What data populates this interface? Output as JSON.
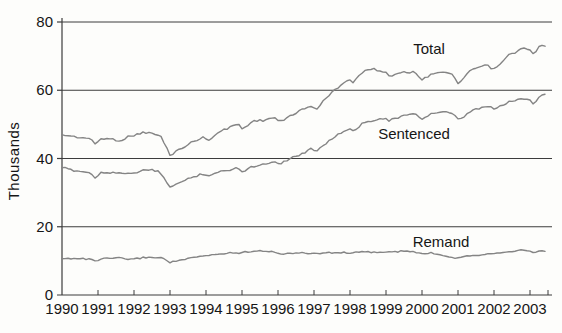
{
  "figure": {
    "background": "#fdfdfb",
    "description_visible_text_only": true
  },
  "chart_data": {
    "type": "line",
    "title": "",
    "xlabel": "",
    "ylabel": "Thousands",
    "ylim": [
      0,
      80
    ],
    "yticks": [
      0,
      20,
      40,
      60,
      80
    ],
    "x_years": [
      1990,
      1991,
      1992,
      1993,
      1994,
      1995,
      1996,
      1997,
      1998,
      1999,
      2000,
      2001,
      2002,
      2003
    ],
    "x_range": [
      1990.0,
      2003.45
    ],
    "grid": "horizontal-only",
    "legend_position": "inline-labels",
    "line_color": "#848484",
    "axis_color": "#3c3c3c",
    "text_color": "#161616",
    "series": [
      {
        "name": "Total",
        "jitter_px": 1.1,
        "points": [
          [
            1990.0,
            47.0
          ],
          [
            1990.35,
            46.4
          ],
          [
            1990.75,
            45.9
          ],
          [
            1990.92,
            44.3
          ],
          [
            1991.1,
            45.9
          ],
          [
            1991.45,
            45.6
          ],
          [
            1991.6,
            45.2
          ],
          [
            1991.9,
            46.6
          ],
          [
            1992.3,
            47.7
          ],
          [
            1992.55,
            47.2
          ],
          [
            1992.75,
            46.4
          ],
          [
            1993.0,
            41.0
          ],
          [
            1993.3,
            42.9
          ],
          [
            1993.6,
            44.7
          ],
          [
            1993.9,
            46.2
          ],
          [
            1994.05,
            45.4
          ],
          [
            1994.4,
            47.9
          ],
          [
            1994.9,
            50.3
          ],
          [
            1995.02,
            48.4
          ],
          [
            1995.25,
            50.8
          ],
          [
            1995.6,
            51.2
          ],
          [
            1995.9,
            52.1
          ],
          [
            1996.05,
            50.6
          ],
          [
            1996.5,
            53.5
          ],
          [
            1996.95,
            55.5
          ],
          [
            1997.07,
            54.4
          ],
          [
            1997.3,
            57.3
          ],
          [
            1997.6,
            60.3
          ],
          [
            1997.95,
            63.3
          ],
          [
            1998.08,
            62.4
          ],
          [
            1998.35,
            65.2
          ],
          [
            1998.6,
            66.4
          ],
          [
            1998.95,
            65.4
          ],
          [
            1999.1,
            64.2
          ],
          [
            1999.5,
            65.5
          ],
          [
            1999.85,
            65.1
          ],
          [
            2000.0,
            62.9
          ],
          [
            2000.25,
            64.8
          ],
          [
            2000.55,
            65.5
          ],
          [
            2000.85,
            64.4
          ],
          [
            2001.02,
            61.9
          ],
          [
            2001.4,
            66.2
          ],
          [
            2001.8,
            67.3
          ],
          [
            2002.02,
            66.0
          ],
          [
            2002.4,
            70.2
          ],
          [
            2002.75,
            72.0
          ],
          [
            2002.95,
            72.4
          ],
          [
            2003.1,
            70.3
          ],
          [
            2003.3,
            73.3
          ],
          [
            2003.45,
            72.8
          ]
        ]
      },
      {
        "name": "Sentenced",
        "jitter_px": 1.1,
        "points": [
          [
            1990.0,
            37.3
          ],
          [
            1990.35,
            36.5
          ],
          [
            1990.75,
            35.9
          ],
          [
            1990.92,
            34.5
          ],
          [
            1991.1,
            35.9
          ],
          [
            1991.5,
            36.0
          ],
          [
            1991.9,
            35.3
          ],
          [
            1992.1,
            36.1
          ],
          [
            1992.4,
            36.8
          ],
          [
            1992.7,
            36.0
          ],
          [
            1993.0,
            31.8
          ],
          [
            1993.3,
            33.0
          ],
          [
            1993.6,
            34.4
          ],
          [
            1993.9,
            35.6
          ],
          [
            1994.05,
            35.0
          ],
          [
            1994.4,
            36.1
          ],
          [
            1994.9,
            37.3
          ],
          [
            1995.02,
            36.2
          ],
          [
            1995.25,
            37.5
          ],
          [
            1995.6,
            38.3
          ],
          [
            1995.9,
            39.2
          ],
          [
            1996.05,
            38.5
          ],
          [
            1996.35,
            40.1
          ],
          [
            1996.65,
            41.3
          ],
          [
            1996.95,
            42.9
          ],
          [
            1997.07,
            42.3
          ],
          [
            1997.3,
            44.3
          ],
          [
            1997.6,
            46.6
          ],
          [
            1997.95,
            48.6
          ],
          [
            1998.08,
            48.1
          ],
          [
            1998.35,
            50.2
          ],
          [
            1998.7,
            51.5
          ],
          [
            1998.95,
            51.9
          ],
          [
            1999.1,
            51.1
          ],
          [
            1999.5,
            52.6
          ],
          [
            1999.85,
            52.9
          ],
          [
            2000.0,
            51.6
          ],
          [
            2000.25,
            53.1
          ],
          [
            2000.55,
            53.7
          ],
          [
            2000.85,
            53.1
          ],
          [
            2001.02,
            51.1
          ],
          [
            2001.4,
            54.1
          ],
          [
            2001.8,
            55.3
          ],
          [
            2002.02,
            54.5
          ],
          [
            2002.4,
            56.5
          ],
          [
            2002.75,
            57.4
          ],
          [
            2002.95,
            57.7
          ],
          [
            2003.1,
            55.9
          ],
          [
            2003.3,
            58.7
          ],
          [
            2003.45,
            58.9
          ]
        ]
      },
      {
        "name": "Remand",
        "jitter_px": 0.75,
        "points": [
          [
            1990.0,
            10.6
          ],
          [
            1990.4,
            10.8
          ],
          [
            1990.8,
            10.4
          ],
          [
            1990.95,
            10.0
          ],
          [
            1991.2,
            10.7
          ],
          [
            1991.6,
            10.8
          ],
          [
            1991.95,
            10.4
          ],
          [
            1992.2,
            10.9
          ],
          [
            1992.5,
            11.1
          ],
          [
            1992.8,
            10.8
          ],
          [
            1993.0,
            9.6
          ],
          [
            1993.4,
            10.4
          ],
          [
            1993.8,
            11.2
          ],
          [
            1994.2,
            11.8
          ],
          [
            1994.6,
            12.3
          ],
          [
            1995.0,
            12.4
          ],
          [
            1995.35,
            13.0
          ],
          [
            1995.7,
            12.9
          ],
          [
            1996.05,
            12.1
          ],
          [
            1996.5,
            12.3
          ],
          [
            1997.0,
            12.2
          ],
          [
            1997.5,
            12.4
          ],
          [
            1998.0,
            12.4
          ],
          [
            1998.5,
            12.6
          ],
          [
            1999.0,
            12.5
          ],
          [
            1999.6,
            12.9
          ],
          [
            2000.0,
            12.1
          ],
          [
            2000.3,
            12.3
          ],
          [
            2000.9,
            10.9
          ],
          [
            2001.3,
            11.5
          ],
          [
            2001.7,
            11.9
          ],
          [
            2002.1,
            12.4
          ],
          [
            2002.5,
            12.9
          ],
          [
            2002.9,
            13.1
          ],
          [
            2003.1,
            12.5
          ],
          [
            2003.3,
            13.0
          ],
          [
            2003.45,
            12.7
          ]
        ]
      }
    ]
  }
}
